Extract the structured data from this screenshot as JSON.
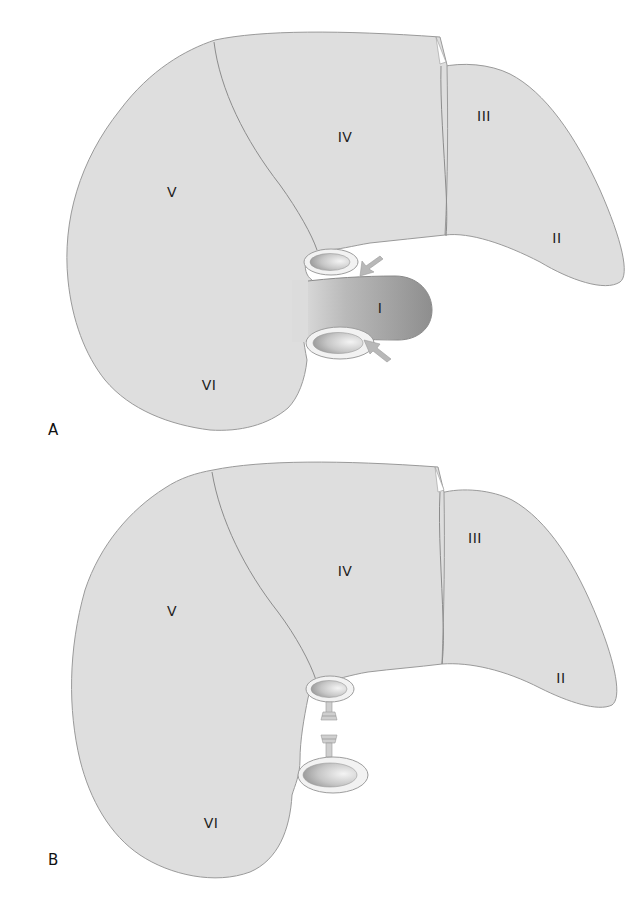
{
  "figure": {
    "panels": [
      {
        "id": "A",
        "label": "A",
        "segments": [
          {
            "label": "II"
          },
          {
            "label": "III"
          },
          {
            "label": "IV"
          },
          {
            "label": "V"
          },
          {
            "label": "VI"
          },
          {
            "label": "I"
          }
        ],
        "vessels": [
          "upper-vessel",
          "lower-vessel"
        ],
        "arrows": 2,
        "caudate_lobe_shaded": true
      },
      {
        "id": "B",
        "label": "B",
        "segments": [
          {
            "label": "II"
          },
          {
            "label": "III"
          },
          {
            "label": "IV"
          },
          {
            "label": "V"
          },
          {
            "label": "VI"
          }
        ],
        "vessels": [
          "upper-vessel",
          "lower-vessel"
        ],
        "ligated_stumps": 2,
        "caudate_lobe_shaded": false
      }
    ]
  },
  "colors": {
    "parenchyma": "#dedede",
    "caudate_dark": "#8f8f8f",
    "outline": "#9a9a9a",
    "text": "#222222"
  }
}
